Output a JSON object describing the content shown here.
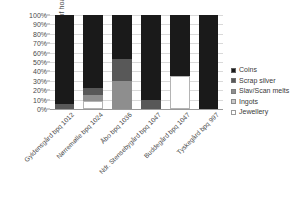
{
  "chart_data": {
    "type": "bar",
    "stacked": true,
    "normalized": "100%",
    "title": "",
    "xlabel": "",
    "ylabel": "Proportion of hoard weight",
    "ylim": [
      0,
      100
    ],
    "ytick_labels": [
      "100%",
      "90%",
      "80%",
      "70%",
      "60%",
      "50%",
      "40%",
      "30%",
      "20%",
      "10%",
      "0%"
    ],
    "ytick_values": [
      100,
      90,
      80,
      70,
      60,
      50,
      40,
      30,
      20,
      10,
      0
    ],
    "grid": true,
    "legend_position": "right",
    "categories": [
      "Gyldensgård bpq 1012",
      "Nørremølle bpq 1024",
      "Åbo bpq 1036",
      "Ndr. Stensebygård bpq 1047",
      "Buddegård bpq 1047",
      "Tyskegård bpq 997"
    ],
    "series": [
      {
        "name": "Coins",
        "color": "#1a1a1a",
        "values": [
          95,
          78,
          47,
          90,
          65,
          100
        ]
      },
      {
        "name": "Scrap silver",
        "color": "#585858",
        "values": [
          5,
          7,
          23,
          10,
          0,
          0
        ]
      },
      {
        "name": "Slav/Scan melts",
        "color": "#8e8e8e",
        "values": [
          0,
          7,
          30,
          0,
          0,
          0
        ]
      },
      {
        "name": "Ingots",
        "color": "#c9c9c9",
        "values": [
          0,
          0,
          0,
          0,
          0,
          0
        ]
      },
      {
        "name": "Jewellery",
        "color": "#ffffff",
        "values": [
          0,
          8,
          0,
          0,
          35,
          0
        ]
      }
    ]
  },
  "legend": {
    "items": [
      {
        "label": "Coins",
        "color": "#1a1a1a"
      },
      {
        "label": "Scrap silver",
        "color": "#585858"
      },
      {
        "label": "Slav/Scan melts",
        "color": "#8e8e8e"
      },
      {
        "label": "Ingots",
        "color": "#c9c9c9"
      },
      {
        "label": "Jewellery",
        "color": "#ffffff"
      }
    ]
  }
}
